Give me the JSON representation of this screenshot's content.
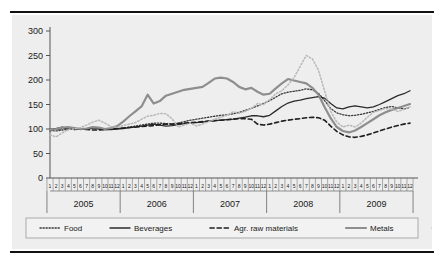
{
  "chart_data": {
    "type": "line",
    "title": "",
    "subtitle": "",
    "xlabel": "",
    "ylabel": "",
    "ylim": [
      0,
      300
    ],
    "yticks": [
      0,
      50,
      100,
      150,
      200,
      250,
      300
    ],
    "grid": false,
    "legend_position": "bottom",
    "x_months": [
      1,
      2,
      3,
      4,
      5,
      6,
      7,
      8,
      9,
      10,
      11,
      12
    ],
    "x_years": [
      "2005",
      "2006",
      "2007",
      "2008",
      "2009"
    ],
    "x": [
      "2005-1",
      "2005-2",
      "2005-3",
      "2005-4",
      "2005-5",
      "2005-6",
      "2005-7",
      "2005-8",
      "2005-9",
      "2005-10",
      "2005-11",
      "2005-12",
      "2006-1",
      "2006-2",
      "2006-3",
      "2006-4",
      "2006-5",
      "2006-6",
      "2006-7",
      "2006-8",
      "2006-9",
      "2006-10",
      "2006-11",
      "2006-12",
      "2007-1",
      "2007-2",
      "2007-3",
      "2007-4",
      "2007-5",
      "2007-6",
      "2007-7",
      "2007-8",
      "2007-9",
      "2007-10",
      "2007-11",
      "2007-12",
      "2008-1",
      "2008-2",
      "2008-3",
      "2008-4",
      "2008-5",
      "2008-6",
      "2008-7",
      "2008-8",
      "2008-9",
      "2008-10",
      "2008-11",
      "2008-12",
      "2009-1",
      "2009-2",
      "2009-3",
      "2009-4",
      "2009-5",
      "2009-6",
      "2009-7",
      "2009-8",
      "2009-9",
      "2009-10",
      "2009-11",
      "2009-12"
    ],
    "series": [
      {
        "name": "Food",
        "color": "#3a3a3a",
        "style": "dotted",
        "width": 1.3,
        "values": [
          97,
          96,
          98,
          99,
          100,
          99,
          100,
          101,
          100,
          99,
          100,
          101,
          102,
          104,
          106,
          108,
          110,
          112,
          112,
          111,
          110,
          112,
          115,
          118,
          120,
          122,
          124,
          126,
          128,
          129,
          131,
          134,
          138,
          142,
          147,
          152,
          158,
          165,
          172,
          175,
          177,
          179,
          182,
          180,
          173,
          158,
          142,
          133,
          129,
          127,
          128,
          130,
          133,
          136,
          140,
          144,
          146,
          143,
          141,
          144
        ]
      },
      {
        "name": "Beverages",
        "color": "#2b2b2b",
        "style": "solid",
        "width": 1.3,
        "values": [
          96,
          101,
          104,
          101,
          99,
          100,
          100,
          103,
          101,
          99,
          99,
          100,
          101,
          103,
          104,
          106,
          108,
          110,
          108,
          106,
          107,
          109,
          111,
          112,
          113,
          114,
          116,
          117,
          118,
          119,
          120,
          122,
          124,
          127,
          127,
          125,
          128,
          137,
          146,
          153,
          157,
          159,
          162,
          164,
          166,
          163,
          152,
          143,
          141,
          145,
          147,
          145,
          143,
          145,
          150,
          156,
          162,
          168,
          172,
          178
        ]
      },
      {
        "name": "Agr. raw materials",
        "color": "#1f1f1f",
        "style": "dashed",
        "width": 1.6,
        "values": [
          99,
          100,
          101,
          102,
          101,
          100,
          99,
          98,
          98,
          99,
          100,
          101,
          102,
          103,
          104,
          105,
          106,
          107,
          109,
          110,
          110,
          111,
          112,
          113,
          114,
          115,
          116,
          117,
          118,
          119,
          120,
          121,
          121,
          120,
          110,
          108,
          110,
          113,
          116,
          118,
          120,
          121,
          123,
          124,
          123,
          118,
          106,
          95,
          88,
          84,
          83,
          85,
          88,
          92,
          96,
          100,
          104,
          107,
          110,
          112
        ]
      },
      {
        "name": "Metals",
        "color": "#8e8e8e",
        "style": "solid",
        "width": 2.2,
        "values": [
          98,
          100,
          103,
          104,
          102,
          100,
          101,
          104,
          103,
          100,
          102,
          106,
          115,
          126,
          136,
          146,
          170,
          152,
          157,
          168,
          172,
          176,
          180,
          182,
          184,
          186,
          194,
          203,
          205,
          203,
          196,
          186,
          181,
          184,
          176,
          170,
          172,
          183,
          193,
          202,
          199,
          196,
          193,
          184,
          170,
          145,
          122,
          104,
          96,
          93,
          97,
          104,
          112,
          120,
          128,
          134,
          139,
          143,
          147,
          151
        ]
      },
      {
        "name": "Energy",
        "color": "#b8b8b8",
        "style": "dotted",
        "width": 1.5,
        "values": [
          88,
          84,
          92,
          99,
          100,
          103,
          108,
          114,
          118,
          112,
          105,
          103,
          107,
          110,
          113,
          120,
          126,
          128,
          132,
          131,
          121,
          104,
          108,
          112,
          106,
          110,
          115,
          120,
          124,
          128,
          135,
          132,
          136,
          142,
          152,
          150,
          160,
          172,
          178,
          190,
          205,
          228,
          250,
          243,
          220,
          178,
          136,
          114,
          104,
          108,
          104,
          112,
          124,
          134,
          138,
          142,
          140,
          136,
          140,
          145
        ]
      }
    ]
  },
  "legend": {
    "items": [
      {
        "label": "Food"
      },
      {
        "label": "Beverages"
      },
      {
        "label": "Agr. raw materials"
      },
      {
        "label": "Metals"
      },
      {
        "label": "Energy"
      }
    ]
  }
}
